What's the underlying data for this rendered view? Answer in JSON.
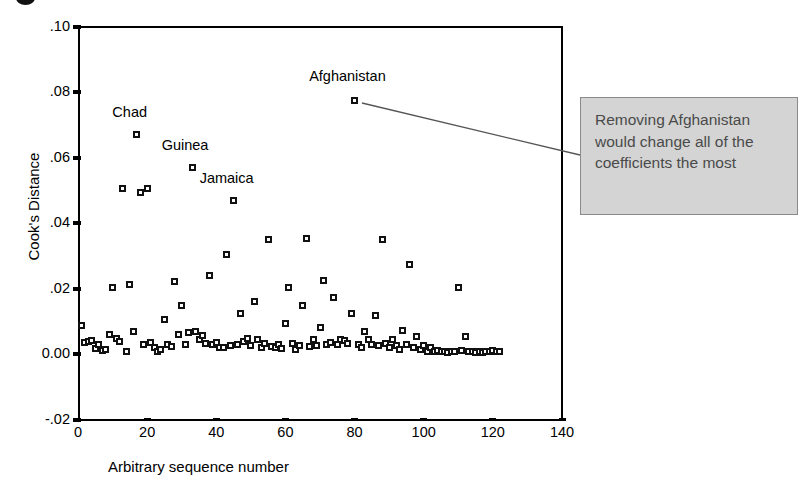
{
  "chart_data": {
    "type": "scatter",
    "title": "",
    "xlabel": "Arbitrary sequence number",
    "ylabel": "Cook's Distance",
    "xlim": [
      0,
      140
    ],
    "ylim": [
      -0.02,
      0.1
    ],
    "xticks": [
      "0",
      "20",
      "40",
      "60",
      "80",
      "100",
      "120",
      "140"
    ],
    "xtick_values": [
      0,
      20,
      40,
      60,
      80,
      100,
      120,
      140
    ],
    "yticks": [
      ".10",
      ".08",
      ".06",
      ".04",
      ".02",
      "0.00",
      "-.02"
    ],
    "ytick_values": [
      0.1,
      0.08,
      0.06,
      0.04,
      0.02,
      0.0,
      -0.02
    ],
    "grid": false,
    "legend": "none",
    "marker": "open-square",
    "marker_color": "#111111",
    "annotations": [
      {
        "text": "Chad",
        "x": 17,
        "y": 0.067,
        "label_x": 15,
        "label_y": 0.0735
      },
      {
        "text": "Guinea",
        "x": 33,
        "y": 0.057,
        "label_x": 31,
        "label_y": 0.0635
      },
      {
        "text": "Jamaica",
        "x": 45,
        "y": 0.047,
        "label_x": 43,
        "label_y": 0.0535
      },
      {
        "text": "Afghanistan",
        "x": 80,
        "y": 0.0775,
        "label_x": 78,
        "label_y": 0.0845
      }
    ],
    "points": [
      {
        "x": 1,
        "y": 0.0088
      },
      {
        "x": 2,
        "y": 0.0035
      },
      {
        "x": 3,
        "y": 0.004
      },
      {
        "x": 4,
        "y": 0.0042
      },
      {
        "x": 5,
        "y": 0.0018
      },
      {
        "x": 6,
        "y": 0.003
      },
      {
        "x": 7,
        "y": 0.0012
      },
      {
        "x": 8,
        "y": 0.0016
      },
      {
        "x": 9,
        "y": 0.0062
      },
      {
        "x": 10,
        "y": 0.0205
      },
      {
        "x": 11,
        "y": 0.0048
      },
      {
        "x": 12,
        "y": 0.0038
      },
      {
        "x": 13,
        "y": 0.0505
      },
      {
        "x": 14,
        "y": 0.001
      },
      {
        "x": 15,
        "y": 0.0212
      },
      {
        "x": 16,
        "y": 0.007
      },
      {
        "x": 17,
        "y": 0.067
      },
      {
        "x": 18,
        "y": 0.0495
      },
      {
        "x": 19,
        "y": 0.003
      },
      {
        "x": 20,
        "y": 0.0505
      },
      {
        "x": 21,
        "y": 0.0036
      },
      {
        "x": 22,
        "y": 0.002
      },
      {
        "x": 23,
        "y": 0.0008
      },
      {
        "x": 24,
        "y": 0.0014
      },
      {
        "x": 25,
        "y": 0.0106
      },
      {
        "x": 26,
        "y": 0.003
      },
      {
        "x": 27,
        "y": 0.0024
      },
      {
        "x": 28,
        "y": 0.0222
      },
      {
        "x": 29,
        "y": 0.0062
      },
      {
        "x": 30,
        "y": 0.015
      },
      {
        "x": 31,
        "y": 0.003
      },
      {
        "x": 32,
        "y": 0.0066
      },
      {
        "x": 33,
        "y": 0.057
      },
      {
        "x": 34,
        "y": 0.007
      },
      {
        "x": 35,
        "y": 0.0046
      },
      {
        "x": 36,
        "y": 0.0058
      },
      {
        "x": 37,
        "y": 0.0032
      },
      {
        "x": 38,
        "y": 0.024
      },
      {
        "x": 39,
        "y": 0.003
      },
      {
        "x": 40,
        "y": 0.0036
      },
      {
        "x": 41,
        "y": 0.0022
      },
      {
        "x": 42,
        "y": 0.002
      },
      {
        "x": 43,
        "y": 0.0305
      },
      {
        "x": 44,
        "y": 0.0026
      },
      {
        "x": 45,
        "y": 0.047
      },
      {
        "x": 46,
        "y": 0.003
      },
      {
        "x": 47,
        "y": 0.0126
      },
      {
        "x": 48,
        "y": 0.004
      },
      {
        "x": 49,
        "y": 0.005
      },
      {
        "x": 50,
        "y": 0.0026
      },
      {
        "x": 51,
        "y": 0.016
      },
      {
        "x": 52,
        "y": 0.0046
      },
      {
        "x": 53,
        "y": 0.002
      },
      {
        "x": 54,
        "y": 0.0034
      },
      {
        "x": 55,
        "y": 0.035
      },
      {
        "x": 56,
        "y": 0.0024
      },
      {
        "x": 57,
        "y": 0.002
      },
      {
        "x": 58,
        "y": 0.003
      },
      {
        "x": 59,
        "y": 0.0018
      },
      {
        "x": 60,
        "y": 0.0094
      },
      {
        "x": 61,
        "y": 0.0205
      },
      {
        "x": 62,
        "y": 0.0032
      },
      {
        "x": 63,
        "y": 0.0016
      },
      {
        "x": 64,
        "y": 0.0026
      },
      {
        "x": 65,
        "y": 0.015
      },
      {
        "x": 66,
        "y": 0.0352
      },
      {
        "x": 67,
        "y": 0.0024
      },
      {
        "x": 68,
        "y": 0.0046
      },
      {
        "x": 69,
        "y": 0.0028
      },
      {
        "x": 70,
        "y": 0.0082
      },
      {
        "x": 71,
        "y": 0.0226
      },
      {
        "x": 72,
        "y": 0.003
      },
      {
        "x": 73,
        "y": 0.0036
      },
      {
        "x": 74,
        "y": 0.0175
      },
      {
        "x": 75,
        "y": 0.003
      },
      {
        "x": 76,
        "y": 0.0046
      },
      {
        "x": 77,
        "y": 0.0042
      },
      {
        "x": 78,
        "y": 0.0032
      },
      {
        "x": 79,
        "y": 0.0124
      },
      {
        "x": 80,
        "y": 0.0775
      },
      {
        "x": 81,
        "y": 0.003
      },
      {
        "x": 82,
        "y": 0.0022
      },
      {
        "x": 83,
        "y": 0.007
      },
      {
        "x": 84,
        "y": 0.0044
      },
      {
        "x": 85,
        "y": 0.003
      },
      {
        "x": 86,
        "y": 0.012
      },
      {
        "x": 87,
        "y": 0.0026
      },
      {
        "x": 88,
        "y": 0.035
      },
      {
        "x": 89,
        "y": 0.0032
      },
      {
        "x": 90,
        "y": 0.002
      },
      {
        "x": 91,
        "y": 0.0044
      },
      {
        "x": 92,
        "y": 0.0028
      },
      {
        "x": 93,
        "y": 0.0016
      },
      {
        "x": 94,
        "y": 0.0074
      },
      {
        "x": 95,
        "y": 0.003
      },
      {
        "x": 96,
        "y": 0.0275
      },
      {
        "x": 97,
        "y": 0.002
      },
      {
        "x": 98,
        "y": 0.0056
      },
      {
        "x": 99,
        "y": 0.0014
      },
      {
        "x": 100,
        "y": 0.0026
      },
      {
        "x": 101,
        "y": 0.001
      },
      {
        "x": 102,
        "y": 0.002
      },
      {
        "x": 103,
        "y": 0.0008
      },
      {
        "x": 104,
        "y": 0.0012
      },
      {
        "x": 105,
        "y": 0.0008
      },
      {
        "x": 106,
        "y": 0.001
      },
      {
        "x": 107,
        "y": 0.0006
      },
      {
        "x": 108,
        "y": 0.001
      },
      {
        "x": 109,
        "y": 0.0008
      },
      {
        "x": 110,
        "y": 0.0205
      },
      {
        "x": 111,
        "y": 0.0012
      },
      {
        "x": 112,
        "y": 0.0054
      },
      {
        "x": 113,
        "y": 0.0008
      },
      {
        "x": 114,
        "y": 0.001
      },
      {
        "x": 115,
        "y": 0.0006
      },
      {
        "x": 116,
        "y": 0.0008
      },
      {
        "x": 117,
        "y": 0.0006
      },
      {
        "x": 118,
        "y": 0.001
      },
      {
        "x": 119,
        "y": 0.0008
      },
      {
        "x": 120,
        "y": 0.0012
      },
      {
        "x": 121,
        "y": 0.0008
      },
      {
        "x": 122,
        "y": 0.001
      }
    ]
  },
  "callout": {
    "text": "Removing Afghanistan would change all of the coefficients the most",
    "fill_color": "#d4d4d4",
    "border_color": "#8a8a8a",
    "text_color": "#4a4a4a"
  }
}
